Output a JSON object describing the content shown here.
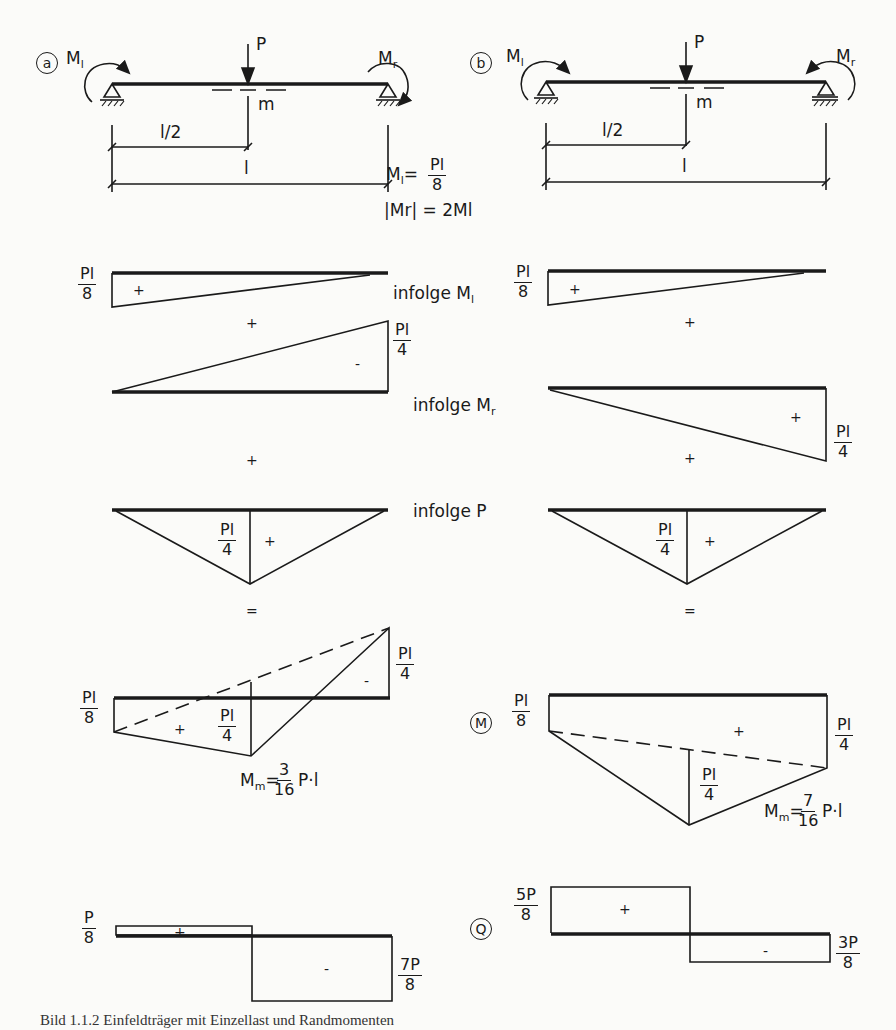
{
  "figure": {
    "caption": "Bild 1.1.2 Einfeldträger mit Einzellast und Randmomenten",
    "line_color": "#1a1a1a",
    "background": "#fbfbf9"
  },
  "case_a": {
    "marker": "a",
    "moment_left": "M",
    "moment_left_sub": "l",
    "moment_right": "M",
    "moment_right_sub": "r",
    "load": "P",
    "midpoint": "m",
    "dim_half": "l/2",
    "dim_full": "l",
    "condition_1_lhs": "M",
    "condition_1_sub": "l",
    "condition_1_eq": "=",
    "condition_1_num": "Pl",
    "condition_1_den": "8",
    "condition_2": "|Mr| = 2Ml",
    "diag_Ml": {
      "value_num": "Pl",
      "value_den": "8",
      "sign": "+"
    },
    "plus_1": "+",
    "diag_Mr": {
      "value_num": "Pl",
      "value_den": "4",
      "sign": "-"
    },
    "plus_2": "+",
    "diag_P": {
      "value_num": "Pl",
      "value_den": "4",
      "sign": "+"
    },
    "equals": "=",
    "moment_result": {
      "left_num": "Pl",
      "left_den": "8",
      "right_num": "Pl",
      "right_den": "4",
      "mid_num": "Pl",
      "mid_den": "4",
      "sign_pos": "+",
      "sign_neg": "-",
      "Mm_label": "M",
      "Mm_sub": "m",
      "Mm_eq": "=",
      "Mm_num": "3",
      "Mm_den": "16",
      "Mm_suffix": "P·l"
    },
    "shear_result": {
      "left_num": "P",
      "left_den": "8",
      "right_num": "7P",
      "right_den": "8",
      "sign_pos": "+",
      "sign_neg": "-"
    }
  },
  "case_b": {
    "marker": "b",
    "moment_left": "M",
    "moment_left_sub": "l",
    "moment_right": "M",
    "moment_right_sub": "r",
    "load": "P",
    "midpoint": "m",
    "dim_half": "l/2",
    "dim_full": "l",
    "diag_Ml": {
      "value_num": "Pl",
      "value_den": "8",
      "sign": "+"
    },
    "plus_1": "+",
    "diag_Mr": {
      "value_num": "Pl",
      "value_den": "4",
      "sign": "+"
    },
    "plus_2": "+",
    "diag_P": {
      "value_num": "Pl",
      "value_den": "4",
      "sign": "+"
    },
    "equals": "=",
    "moment_marker": "M",
    "moment_result": {
      "left_num": "Pl",
      "left_den": "8",
      "right_num": "Pl",
      "right_den": "4",
      "mid_num": "Pl",
      "mid_den": "4",
      "sign_pos": "+",
      "Mm_label": "M",
      "Mm_sub": "m",
      "Mm_eq": "=",
      "Mm_num": "7",
      "Mm_den": "16",
      "Mm_suffix": "P·l"
    },
    "shear_marker": "Q",
    "shear_result": {
      "left_num": "5P",
      "left_den": "8",
      "right_num": "3P",
      "right_den": "8",
      "sign_pos": "+",
      "sign_neg": "-"
    }
  },
  "row_labels": {
    "infolge_Ml": "infolge M",
    "infolge_Ml_sub": "l",
    "infolge_Mr": "infolge M",
    "infolge_Mr_sub": "r",
    "infolge_P": "infolge P"
  }
}
